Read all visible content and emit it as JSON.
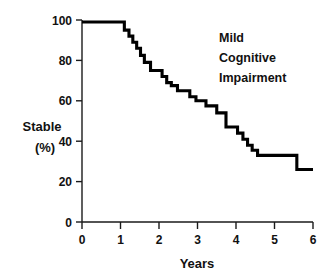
{
  "chart_data": {
    "type": "line",
    "subtype": "kaplan-meier-step",
    "title": "",
    "annotation": [
      "Mild",
      "Cognitive",
      "Impairment"
    ],
    "annotation_text": "Mild Cognitive Impairment",
    "xlabel": "Years",
    "ylabel_line1": "Stable",
    "ylabel_line2": "(%)",
    "ylabel": "Stable (%)",
    "xlim": [
      0,
      6
    ],
    "ylim": [
      0,
      100
    ],
    "xticks": [
      0,
      1,
      2,
      3,
      4,
      5,
      6
    ],
    "xtick_labels": [
      "0",
      "1",
      "2",
      "3",
      "4",
      "5",
      "6"
    ],
    "yticks": [
      0,
      20,
      40,
      60,
      80,
      100
    ],
    "ytick_labels": [
      "0",
      "20",
      "40",
      "60",
      "80",
      "100"
    ],
    "grid": false,
    "legend": false,
    "series": [
      {
        "name": "Mild Cognitive Impairment",
        "color": "#000000",
        "step": "post",
        "x": [
          0.0,
          1.02,
          1.1,
          1.22,
          1.32,
          1.42,
          1.52,
          1.62,
          1.78,
          1.98,
          2.08,
          2.2,
          2.32,
          2.48,
          2.62,
          2.8,
          2.96,
          3.1,
          3.22,
          3.36,
          3.5,
          3.62,
          3.74,
          3.9,
          4.04,
          4.18,
          4.3,
          4.42,
          4.56,
          5.44,
          5.58,
          6.0
        ],
        "y": [
          99.0,
          99.0,
          95.0,
          92.0,
          89.0,
          86.0,
          82.5,
          79.0,
          75.0,
          75.0,
          72.0,
          69.0,
          67.5,
          65.0,
          65.0,
          62.0,
          60.0,
          60.0,
          57.5,
          57.5,
          54.0,
          54.0,
          47.0,
          47.0,
          44.0,
          41.0,
          38.0,
          35.5,
          33.0,
          33.0,
          26.0,
          26.0
        ]
      }
    ]
  },
  "axes": {
    "x_axis_name": "years-axis",
    "y_axis_name": "stable-percent-axis"
  }
}
